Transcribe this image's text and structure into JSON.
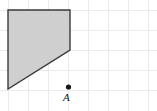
{
  "figure": {
    "width": 157,
    "height": 111,
    "background_color": "#ffffff",
    "grid": {
      "visible": true,
      "spacing": 20,
      "line_color": "#ebebeb",
      "line_width": 1,
      "x_lines": [
        8,
        28,
        48,
        68,
        88,
        108,
        128,
        148
      ],
      "y_lines": [
        10,
        30,
        50,
        70,
        90
      ]
    },
    "shape": {
      "name": "shaded-quadrilateral",
      "type": "polygon",
      "fill_color": "#cfcfcf",
      "stroke_color": "#3a3a3a",
      "stroke_width": 1.4,
      "vertices": [
        {
          "x": 8,
          "y": 10
        },
        {
          "x": 70,
          "y": 10
        },
        {
          "x": 70,
          "y": 50
        },
        {
          "x": 8,
          "y": 89
        }
      ],
      "vertices_grid": [
        {
          "col": 0,
          "row": 0
        },
        {
          "col": 3.1,
          "row": 0
        },
        {
          "col": 3.1,
          "row": 2
        },
        {
          "col": 0,
          "row": 3.95
        }
      ]
    },
    "points": [
      {
        "name": "point-a",
        "label": "A",
        "x": 68.5,
        "y": 87,
        "radius": 2.6,
        "color": "#161616",
        "label_x": 63,
        "label_y": 92
      }
    ]
  }
}
